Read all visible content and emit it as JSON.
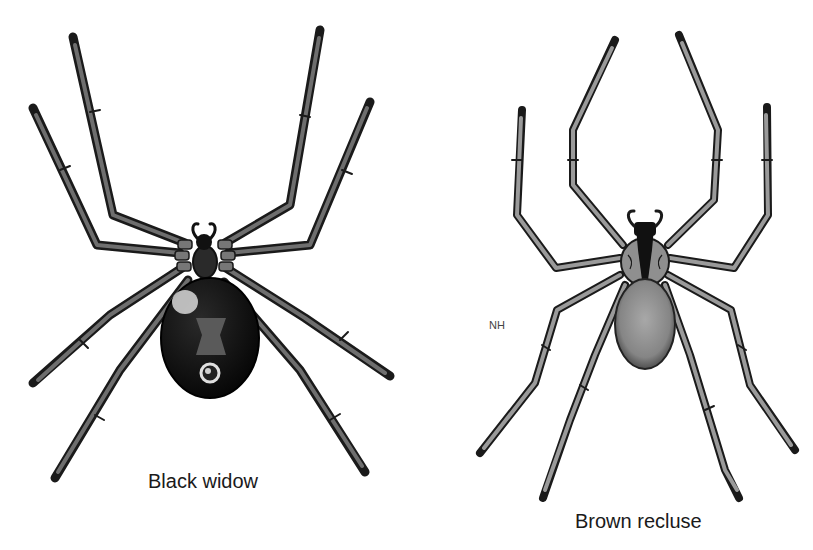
{
  "figure": {
    "panels": [
      {
        "id": "black-widow",
        "caption": "Black widow",
        "colors": {
          "body": "#111111",
          "leg_fill": "#6e6e6e",
          "leg_outline": "#1a1a1a",
          "hourglass": "#5a5a5a"
        }
      },
      {
        "id": "brown-recluse",
        "caption": "Brown recluse",
        "colors": {
          "body": "#8a8a8a",
          "leg_fill": "#9a9a9a",
          "leg_outline": "#1a1a1a",
          "violin_mark": "#111111"
        }
      }
    ],
    "annotation": "NH",
    "background": "#ffffff"
  }
}
